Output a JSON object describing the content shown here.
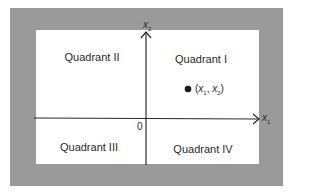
{
  "diagram": {
    "type": "cartesian-plane-quadrants",
    "axes": {
      "horizontal": {
        "name": "x",
        "subscript": "1"
      },
      "vertical": {
        "name": "x",
        "subscript": "2"
      },
      "origin_label": "0"
    },
    "quadrants": [
      {
        "id": "I",
        "label": "Quadrant I"
      },
      {
        "id": "II",
        "label": "Quadrant II"
      },
      {
        "id": "III",
        "label": "Quadrant III"
      },
      {
        "id": "IV",
        "label": "Quadrant IV"
      }
    ],
    "point": {
      "label_open": "(",
      "x_name": "x",
      "x_sub": "1",
      "sep": ", ",
      "y_name": "x",
      "y_sub": "2",
      "label_close": ")",
      "quadrant": "I"
    },
    "colors": {
      "frame": "#9a9a9a",
      "background": "#ffffff",
      "ink": "#2a2a2a"
    }
  }
}
